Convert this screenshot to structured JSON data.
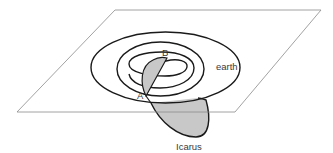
{
  "diagram": {
    "type": "orbit-diagram",
    "labels": {
      "earth": "earth",
      "icarus": "Icarus",
      "point_a": "A",
      "point_b": "B"
    },
    "colors": {
      "background": "#ffffff",
      "plane_stroke": "#8a8a8a",
      "orbit_stroke": "#1a1a1a",
      "icarus_fill": "#c8c8c8",
      "text": "#3a3a3a"
    },
    "elements": [
      {
        "id": "ecliptic-plane",
        "kind": "parallelogram"
      },
      {
        "id": "outer-orbit",
        "kind": "ellipse"
      },
      {
        "id": "earth-orbit",
        "kind": "ellipse"
      },
      {
        "id": "inner-spiral-orbits",
        "kind": "spiral"
      },
      {
        "id": "icarus-orbit-above",
        "kind": "filled-arc",
        "from": "A",
        "to": "B"
      },
      {
        "id": "icarus-orbit-below",
        "kind": "filled-arc"
      }
    ]
  }
}
